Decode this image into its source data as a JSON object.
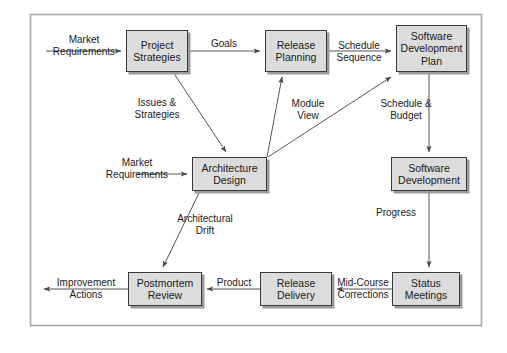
{
  "diagram": {
    "frame": {
      "x": 30,
      "y": 14,
      "w": 452,
      "h": 312
    },
    "style": {
      "node_fill": "#dcdcdc",
      "node_border": "#3a3a3a",
      "node_shadow": "#9a9a9a",
      "edge_color": "#555555",
      "frame_color": "#a9a9a9",
      "text_color": "#1a1a1a",
      "background": "#ffffff"
    },
    "nodes": [
      {
        "id": "project-strategies",
        "label": "Project\nStrategies",
        "lines": [
          "Project",
          "Strategies"
        ],
        "x": 126,
        "y": 30,
        "w": 62,
        "h": 42
      },
      {
        "id": "release-planning",
        "label": "Release\nPlanning",
        "lines": [
          "Release",
          "Planning"
        ],
        "x": 265,
        "y": 30,
        "w": 62,
        "h": 42
      },
      {
        "id": "software-development-plan",
        "label": "Software\nDevelopment\nPlan",
        "lines": [
          "Software",
          "Development",
          "Plan"
        ],
        "x": 396,
        "y": 25,
        "w": 71,
        "h": 47
      },
      {
        "id": "architecture-design",
        "label": "Architecture\nDesign",
        "lines": [
          "Architecture",
          "Design"
        ],
        "x": 192,
        "y": 157,
        "w": 75,
        "h": 34
      },
      {
        "id": "software-development",
        "label": "Software\nDevelopment",
        "lines": [
          "Software",
          "Development"
        ],
        "x": 391,
        "y": 157,
        "w": 76,
        "h": 34
      },
      {
        "id": "postmortem-review",
        "label": "Postmortem\nReview",
        "lines": [
          "Postmortem",
          "Review"
        ],
        "x": 128,
        "y": 272,
        "w": 74,
        "h": 34
      },
      {
        "id": "release-delivery",
        "label": "Release\nDelivery",
        "lines": [
          "Release",
          "Delivery"
        ],
        "x": 260,
        "y": 272,
        "w": 72,
        "h": 34
      },
      {
        "id": "status-meetings",
        "label": "Status\nMeetings",
        "lines": [
          "Status",
          "Meetings"
        ],
        "x": 392,
        "y": 272,
        "w": 68,
        "h": 34
      }
    ],
    "edges": [
      {
        "id": "market-requirements-to-project-strategies",
        "from": "external-left",
        "to": "project-strategies",
        "label": "Market\nRequirements",
        "lines": [
          "Market",
          "Requirements"
        ]
      },
      {
        "id": "project-strategies-to-release-planning",
        "from": "project-strategies",
        "to": "release-planning",
        "label": "Goals",
        "lines": [
          "Goals"
        ]
      },
      {
        "id": "release-planning-to-sdp",
        "from": "release-planning",
        "to": "software-development-plan",
        "label": "Schedule\nSequence",
        "lines": [
          "Schedule",
          "Sequence"
        ]
      },
      {
        "id": "project-strategies-to-architecture-design",
        "from": "project-strategies",
        "to": "architecture-design",
        "label": "Issues &\nStrategies",
        "lines": [
          "Issues &",
          "Strategies"
        ]
      },
      {
        "id": "architecture-design-to-release-planning",
        "from": "architecture-design",
        "to": "release-planning",
        "label": "Module\nView",
        "lines": [
          "Module",
          "View"
        ]
      },
      {
        "id": "architecture-design-to-sdp",
        "from": "architecture-design",
        "to": "software-development-plan",
        "label": "",
        "lines": []
      },
      {
        "id": "market-requirements-to-architecture-design",
        "from": "external-left",
        "to": "architecture-design",
        "label": "Market\nRequirements",
        "lines": [
          "Market",
          "Requirements"
        ]
      },
      {
        "id": "sdp-to-software-development",
        "from": "software-development-plan",
        "to": "software-development",
        "label": "Schedule &\nBudget",
        "lines": [
          "Schedule &",
          "Budget"
        ]
      },
      {
        "id": "software-development-to-status-meetings",
        "from": "software-development",
        "to": "status-meetings",
        "label": "Progress",
        "lines": [
          "Progress"
        ]
      },
      {
        "id": "status-meetings-to-release-delivery",
        "from": "status-meetings",
        "to": "release-delivery",
        "label": "Mid-Course\nCorrections",
        "lines": [
          "Mid-Course",
          "Corrections"
        ]
      },
      {
        "id": "release-delivery-to-postmortem-review",
        "from": "release-delivery",
        "to": "postmortem-review",
        "label": "Product",
        "lines": [
          "Product"
        ]
      },
      {
        "id": "architecture-design-to-postmortem-review",
        "from": "architecture-design",
        "to": "postmortem-review",
        "label": "Architectural\nDrift",
        "lines": [
          "Architectural",
          "Drift"
        ]
      },
      {
        "id": "postmortem-review-to-external",
        "from": "postmortem-review",
        "to": "external-left",
        "label": "Improvement\nActions",
        "lines": [
          "Improvement",
          "Actions"
        ]
      }
    ],
    "edge_labels": {
      "market_requirements_top_l1": "Market",
      "market_requirements_top_l2": "Requirements",
      "goals": "Goals",
      "schedule_sequence_l1": "Schedule",
      "schedule_sequence_l2": "Sequence",
      "issues_strategies_l1": "Issues &",
      "issues_strategies_l2": "Strategies",
      "module_view_l1": "Module",
      "module_view_l2": "View",
      "market_requirements_mid_l1": "Market",
      "market_requirements_mid_l2": "Requirements",
      "schedule_budget_l1": "Schedule &",
      "schedule_budget_l2": "Budget",
      "progress": "Progress",
      "architectural_drift_l1": "Architectural",
      "architectural_drift_l2": "Drift",
      "mid_course_l1": "Mid-Course",
      "mid_course_l2": "Corrections",
      "product": "Product",
      "improvement_l1": "Improvement",
      "improvement_l2": "Actions"
    }
  }
}
